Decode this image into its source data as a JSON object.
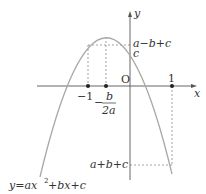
{
  "diagram": {
    "type": "parabola-graph",
    "colors": {
      "curve": "#a8a8a8",
      "axis": "#555555",
      "dashed": "#888888",
      "text": "#333333",
      "point": "#222222"
    },
    "axes": {
      "x_label": "x",
      "y_label": "y",
      "origin_label": "O"
    },
    "x_ticks": [
      {
        "label": "−1",
        "value": -1
      },
      {
        "label": "1",
        "value": 1
      }
    ],
    "vertex_label": {
      "sign": "−",
      "numerator": "b",
      "denominator": "2a"
    },
    "y_labels": {
      "a_minus_b_plus_c": "a−b+c",
      "c": "c",
      "a_plus_b_plus_c": "a+b+c"
    },
    "curve_equation": {
      "prefix": "y=ax",
      "exponent": "2",
      "suffix": "+bx+c"
    }
  }
}
